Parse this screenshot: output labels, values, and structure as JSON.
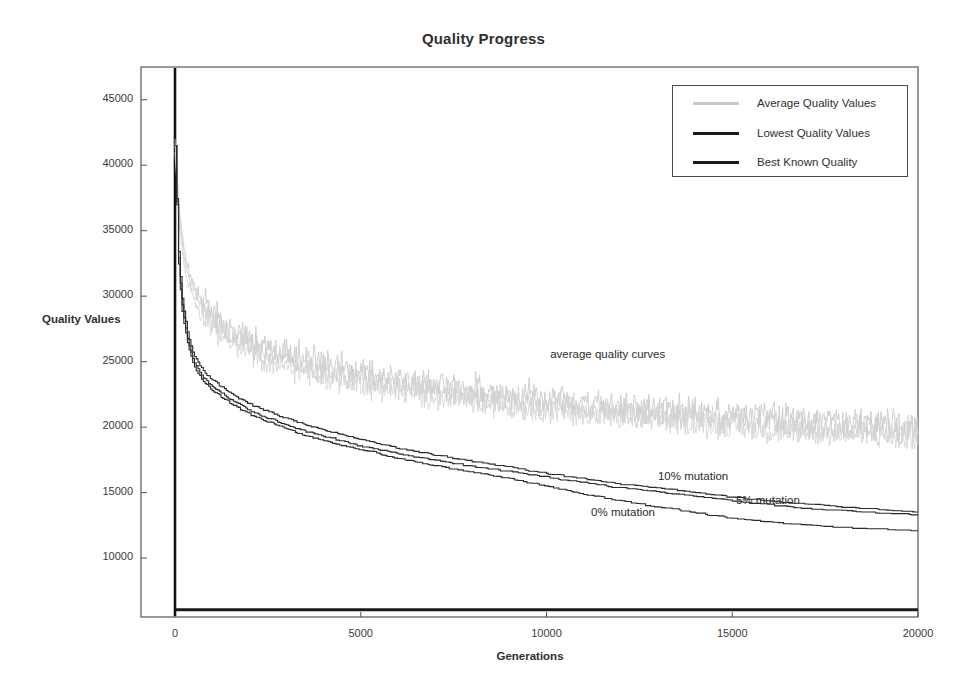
{
  "chart_data": {
    "type": "line",
    "title": "Quality Progress",
    "xlabel": "Generations",
    "ylabel": "Quality Values",
    "xlim": [
      0,
      20000
    ],
    "ylim": [
      5500,
      47500
    ],
    "grid": false,
    "legend_position": "top-right",
    "xticks": [
      0,
      5000,
      10000,
      15000,
      20000
    ],
    "xtick_labels": [
      "0",
      "5000",
      "10000",
      "15000",
      "20000"
    ],
    "yticks": [
      10000,
      15000,
      20000,
      25000,
      30000,
      35000,
      40000,
      45000
    ],
    "ytick_labels": [
      "10000",
      "15000",
      "20000",
      "25000",
      "30000",
      "35000",
      "40000",
      "45000"
    ],
    "legend": [
      {
        "label": "Average Quality Values",
        "color": "#c9c9c9",
        "width": 3
      },
      {
        "label": "Lowest Quality Values",
        "color": "#1a1a1a",
        "width": 3
      },
      {
        "label": "Best Known Quality",
        "color": "#1a1a1a",
        "width": 3
      }
    ],
    "annotations": [
      {
        "text": "average quality curves",
        "x": 10100,
        "y": 25400
      },
      {
        "text": "10% mutation",
        "x": 13000,
        "y": 16100
      },
      {
        "text": "5% mutation",
        "x": 15100,
        "y": 14250
      },
      {
        "text": "0% mutation",
        "x": 11200,
        "y": 13350
      }
    ],
    "series": [
      {
        "name": "Average Quality Values - 0% mutation",
        "kind": "average",
        "color": "#c9c9c9",
        "noise": 1150,
        "x": [
          0,
          120,
          300,
          600,
          1000,
          1500,
          2000,
          3000,
          4000,
          5000,
          6000,
          7000,
          8000,
          9000,
          10000,
          11000,
          12000,
          13000,
          14000,
          15000,
          16000,
          17000,
          18000,
          19000,
          20000
        ],
        "values": [
          42000,
          36500,
          32500,
          30200,
          28600,
          27400,
          26600,
          25500,
          24700,
          24100,
          23600,
          23150,
          22750,
          22400,
          22100,
          21800,
          21500,
          21250,
          21000,
          20800,
          20600,
          20400,
          20250,
          20100,
          20000
        ]
      },
      {
        "name": "Average Quality Values - 5% mutation",
        "kind": "average",
        "color": "#cfcfcf",
        "noise": 1050,
        "x": [
          0,
          120,
          300,
          600,
          1000,
          1500,
          2000,
          3000,
          4000,
          5000,
          6000,
          7000,
          8000,
          9000,
          10000,
          11000,
          12000,
          13000,
          14000,
          15000,
          16000,
          17000,
          18000,
          19000,
          20000
        ],
        "values": [
          41500,
          35800,
          32000,
          29700,
          28100,
          26900,
          26100,
          25000,
          24250,
          23650,
          23150,
          22700,
          22300,
          21950,
          21650,
          21350,
          21050,
          20800,
          20550,
          20350,
          20150,
          19950,
          19800,
          19650,
          19550
        ]
      },
      {
        "name": "Average Quality Values - 10% mutation",
        "kind": "average",
        "color": "#d4d4d4",
        "noise": 1000,
        "x": [
          0,
          120,
          300,
          600,
          1000,
          1500,
          2000,
          3000,
          4000,
          5000,
          6000,
          7000,
          8000,
          9000,
          10000,
          11000,
          12000,
          13000,
          14000,
          15000,
          16000,
          17000,
          18000,
          19000,
          20000
        ],
        "values": [
          41000,
          35200,
          31400,
          29200,
          27600,
          26400,
          25600,
          24500,
          23800,
          23200,
          22700,
          22250,
          21850,
          21500,
          21200,
          20900,
          20600,
          20350,
          20100,
          19900,
          19700,
          19500,
          19350,
          19200,
          19100
        ]
      },
      {
        "name": "Lowest Quality Values - 10% mutation",
        "kind": "lowest",
        "color": "#2a2a2a",
        "x": [
          0,
          100,
          200,
          350,
          500,
          750,
          1000,
          1500,
          2000,
          2500,
          3000,
          3500,
          4000,
          5000,
          6000,
          7000,
          8000,
          9000,
          10000,
          11000,
          12000,
          13000,
          14000,
          15000,
          16000,
          17000,
          18000,
          19000,
          20000
        ],
        "values": [
          41500,
          33000,
          29500,
          27000,
          25500,
          24300,
          23600,
          22600,
          21800,
          21200,
          20700,
          20200,
          19800,
          19100,
          18400,
          17900,
          17400,
          17000,
          16500,
          16100,
          15700,
          15400,
          15050,
          14700,
          14400,
          14150,
          13950,
          13750,
          13600
        ]
      },
      {
        "name": "Lowest Quality Values - 5% mutation",
        "kind": "lowest",
        "color": "#2a2a2a",
        "x": [
          0,
          100,
          200,
          350,
          500,
          750,
          1000,
          1500,
          2000,
          2500,
          3000,
          3500,
          4000,
          5000,
          6000,
          7000,
          8000,
          9000,
          10000,
          11000,
          12000,
          13000,
          14000,
          15000,
          16000,
          17000,
          18000,
          19000,
          20000
        ],
        "values": [
          41500,
          32500,
          29000,
          26500,
          25000,
          23800,
          23100,
          22100,
          21300,
          20700,
          20200,
          19700,
          19300,
          18600,
          18000,
          17500,
          17050,
          16650,
          16200,
          15800,
          15400,
          15100,
          14750,
          14400,
          14100,
          13850,
          13650,
          13500,
          13350
        ]
      },
      {
        "name": "Lowest Quality Values - 0% mutation",
        "kind": "lowest",
        "color": "#2a2a2a",
        "x": [
          0,
          100,
          200,
          350,
          500,
          750,
          1000,
          1500,
          2000,
          2500,
          3000,
          3500,
          4000,
          5000,
          6000,
          7000,
          8000,
          9000,
          10000,
          11000,
          12000,
          13000,
          14000,
          15000,
          16000,
          17000,
          18000,
          19000,
          20000
        ],
        "values": [
          41500,
          32000,
          28500,
          26200,
          24700,
          23500,
          22800,
          21800,
          21000,
          20400,
          19900,
          19400,
          19000,
          18300,
          17650,
          17100,
          16600,
          16100,
          15500,
          14900,
          14400,
          13950,
          13500,
          13100,
          12800,
          12550,
          12400,
          12250,
          12150
        ]
      },
      {
        "name": "Best Known Quality",
        "kind": "constant",
        "color": "#1a1a1a",
        "x": [
          0,
          20000
        ],
        "values": [
          6050,
          6050
        ]
      }
    ]
  }
}
